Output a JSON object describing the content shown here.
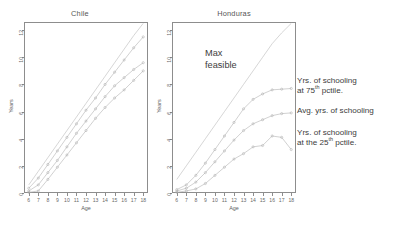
{
  "figure": {
    "xlabel": "Age",
    "ylabel": "Years",
    "annotation_max_feasible": "Max\nfeasible"
  },
  "legend": {
    "items": [
      {
        "pre": "Yrs. of schooling\nat 75",
        "sup": "th",
        "post": " pctile."
      },
      {
        "pre": "Avg. yrs. of schooling",
        "sup": "",
        "post": ""
      },
      {
        "pre": "Yrs. of schooling\nat the 25",
        "sup": "th",
        "post": " pctile."
      }
    ]
  },
  "chart_data": [
    {
      "type": "line",
      "title": "Chile",
      "xlabel": "Age",
      "ylabel": "Years",
      "xlim": [
        5.5,
        18.5
      ],
      "ylim": [
        0,
        12.6
      ],
      "xticks": [
        6,
        7,
        8,
        9,
        10,
        11,
        12,
        13,
        14,
        15,
        16,
        17,
        18
      ],
      "yticks": [
        0,
        2,
        4,
        6,
        8,
        10,
        12
      ],
      "grid": false,
      "legend_position": "right-outside",
      "x": [
        6,
        7,
        8,
        9,
        10,
        11,
        12,
        13,
        14,
        15,
        16,
        17,
        18
      ],
      "series": [
        {
          "name": "Max feasible",
          "values": [
            0.6,
            1.6,
            2.6,
            3.6,
            4.6,
            5.6,
            6.6,
            7.6,
            8.6,
            9.6,
            10.6,
            11.6,
            12.5
          ]
        },
        {
          "name": "Yrs. of schooling at 75th pctile.",
          "values": [
            0.35,
            1.1,
            2.1,
            3.1,
            4.1,
            5.1,
            6.1,
            7.0,
            8.0,
            8.9,
            9.8,
            10.7,
            11.5
          ]
        },
        {
          "name": "Avg. yrs. of schooling",
          "values": [
            0.15,
            0.6,
            1.5,
            2.4,
            3.4,
            4.4,
            5.3,
            6.2,
            7.1,
            7.9,
            8.5,
            9.1,
            9.6
          ]
        },
        {
          "name": "Yrs. of schooling at the 25th pctile.",
          "values": [
            0.05,
            0.15,
            1.0,
            1.9,
            2.8,
            3.7,
            4.6,
            5.5,
            6.3,
            7.0,
            7.6,
            8.3,
            9.0
          ]
        }
      ]
    },
    {
      "type": "line",
      "title": "Honduras",
      "xlabel": "Age",
      "ylabel": "Years",
      "xlim": [
        5.5,
        18.5
      ],
      "ylim": [
        0,
        12.6
      ],
      "xticks": [
        6,
        7,
        8,
        9,
        10,
        11,
        12,
        13,
        14,
        15,
        16,
        17,
        18
      ],
      "yticks": [
        0,
        2,
        4,
        6,
        8,
        10,
        12
      ],
      "grid": false,
      "legend_position": "right-outside",
      "x": [
        6,
        7,
        8,
        9,
        10,
        11,
        12,
        13,
        14,
        15,
        16,
        17,
        18
      ],
      "series": [
        {
          "name": "Max feasible",
          "values": [
            1.0,
            2.0,
            3.0,
            4.0,
            5.0,
            6.0,
            7.0,
            8.0,
            9.0,
            10.0,
            11.0,
            11.8,
            12.5
          ]
        },
        {
          "name": "Yrs. of schooling at 75th pctile.",
          "values": [
            0.25,
            0.6,
            1.3,
            2.2,
            3.2,
            4.2,
            5.2,
            6.2,
            6.9,
            7.3,
            7.6,
            7.65,
            7.7
          ]
        },
        {
          "name": "Avg. yrs. of schooling",
          "values": [
            0.15,
            0.35,
            0.8,
            1.5,
            2.3,
            3.1,
            3.9,
            4.6,
            5.1,
            5.4,
            5.7,
            5.85,
            5.9
          ]
        },
        {
          "name": "Yrs. of schooling at the 25th pctile.",
          "values": [
            0.05,
            0.15,
            0.3,
            0.7,
            1.3,
            1.9,
            2.5,
            2.9,
            3.4,
            3.5,
            4.2,
            4.1,
            3.2
          ]
        }
      ]
    }
  ]
}
